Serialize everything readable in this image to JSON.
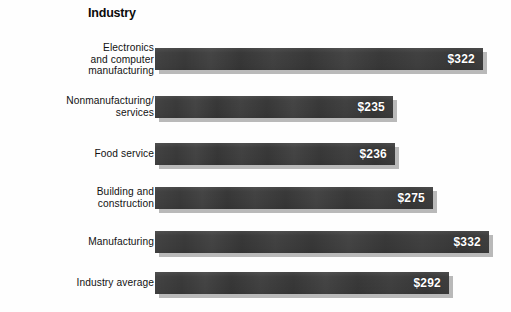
{
  "chart_data": {
    "type": "bar",
    "orientation": "horizontal",
    "title": "Industry",
    "xlabel": "",
    "ylabel": "",
    "grid": false,
    "legend": "none",
    "value_prefix": "$",
    "xlim": [
      0,
      332
    ],
    "categories": [
      "Electronics\nand computer\nmanufacturing",
      "Nonmanufacturing/\nservices",
      "Food service",
      "Building and\nconstruction",
      "Manufacturing",
      "Industry average"
    ],
    "values": [
      322,
      235,
      236,
      275,
      332,
      292
    ],
    "value_labels": [
      "$322",
      "$235",
      "$236",
      "$275",
      "$332",
      "$292"
    ],
    "colors": {
      "bar": "#3b3b3b",
      "bar_shadow": "#b9b9b9",
      "value_text": "#ffffff",
      "label_text": "#121212",
      "title_text": "#0b0b0b",
      "background": "#fefefe"
    }
  },
  "bars": [
    {
      "label": "Electronics\nand computer\nmanufacturing",
      "value": 322,
      "value_label": "$322",
      "lines": 3,
      "row_top": 8,
      "bar_px": 328
    },
    {
      "label": "Nonmanufacturing/\nservices",
      "value": 235,
      "value_label": "$235",
      "lines": 2,
      "row_top": 56,
      "bar_px": 238
    },
    {
      "label": "Food service",
      "value": 236,
      "value_label": "$236",
      "lines": 1,
      "row_top": 103,
      "bar_px": 240
    },
    {
      "label": "Building and\nconstruction",
      "value": 275,
      "value_label": "$275",
      "lines": 2,
      "row_top": 147,
      "bar_px": 278
    },
    {
      "label": "Manufacturing",
      "value": 332,
      "value_label": "$332",
      "lines": 1,
      "row_top": 191,
      "bar_px": 334
    },
    {
      "label": "Industry average",
      "value": 292,
      "value_label": "$292",
      "lines": 1,
      "row_top": 232,
      "bar_px": 294
    }
  ]
}
